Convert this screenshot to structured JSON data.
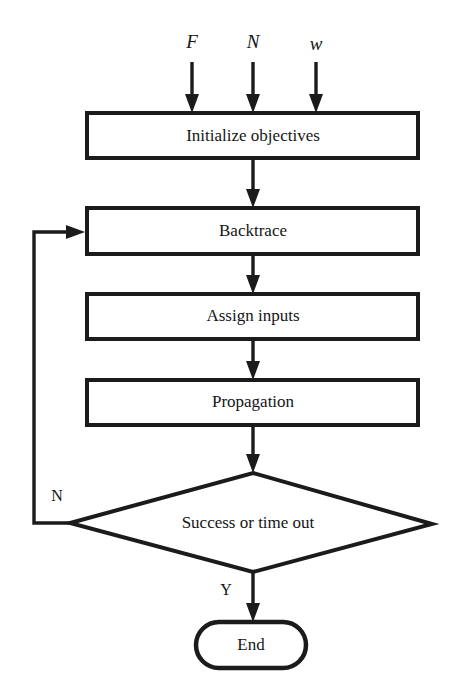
{
  "diagram": {
    "inputs": [
      {
        "label": "F",
        "name": "input-f"
      },
      {
        "label": "N",
        "name": "input-n"
      },
      {
        "label": "w",
        "name": "input-w"
      }
    ],
    "nodes": [
      {
        "id": "initialize",
        "label": "Initialize objectives",
        "shape": "process"
      },
      {
        "id": "backtrace",
        "label": "Backtrace",
        "shape": "process"
      },
      {
        "id": "assign",
        "label": "Assign inputs",
        "shape": "process"
      },
      {
        "id": "propagation",
        "label": "Propagation",
        "shape": "process"
      },
      {
        "id": "decision",
        "label": "Success or time out",
        "shape": "decision"
      },
      {
        "id": "end",
        "label": "End",
        "shape": "terminator"
      }
    ],
    "edge_labels": {
      "no_branch": "N",
      "yes_branch": "Y"
    },
    "colors": {
      "stroke": "#1b1b1b",
      "fill": "#ffffff",
      "text": "#151515"
    }
  }
}
